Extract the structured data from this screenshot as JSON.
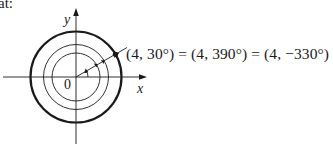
{
  "lead_text": "at:",
  "diagram": {
    "type": "polar-coordinates",
    "axes": {
      "x_label": "x",
      "y_label": "y",
      "origin_label": "0"
    },
    "circles": [
      {
        "name": "inner",
        "radius_units": 2
      },
      {
        "name": "middle",
        "radius_units": 3
      },
      {
        "name": "outer",
        "radius_units": 4,
        "emphasized": true
      }
    ],
    "point": {
      "r": 4,
      "theta_deg": 30
    },
    "equation": "(4, 30°) = (4, 390°) = (4, −330°)",
    "colors": {
      "ink": "#1a1a1a",
      "background": "#ffffff"
    }
  }
}
